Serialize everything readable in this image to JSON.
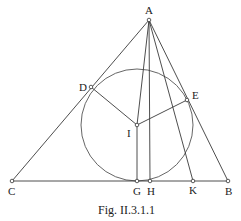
{
  "figure": {
    "caption": "Fig. II.3.1.1",
    "points": {
      "A": {
        "label": "A",
        "x": 149,
        "y": 20
      },
      "B": {
        "label": "B",
        "x": 228,
        "y": 181
      },
      "C": {
        "label": "C",
        "x": 12,
        "y": 181
      },
      "D": {
        "label": "D",
        "x": 91,
        "y": 87
      },
      "E": {
        "label": "E",
        "x": 187,
        "y": 100
      },
      "G": {
        "label": "G",
        "x": 137,
        "y": 181
      },
      "H": {
        "label": "H",
        "x": 150,
        "y": 181
      },
      "I": {
        "label": "I",
        "x": 137,
        "y": 125
      },
      "K": {
        "label": "K",
        "x": 193,
        "y": 181
      }
    },
    "circle": {
      "center": "I",
      "radius": 56
    }
  }
}
